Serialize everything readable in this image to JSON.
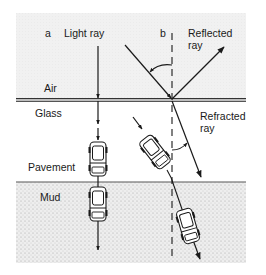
{
  "diagram": {
    "panels": [
      {
        "id": "a",
        "label": "a",
        "ray_label": "Light ray"
      },
      {
        "id": "b",
        "label": "b"
      }
    ],
    "media": {
      "air": "Air",
      "glass": "Glass",
      "pavement": "Pavement",
      "mud": "Mud"
    },
    "rays": {
      "reflected_line1": "Reflected",
      "reflected_line2": "ray",
      "refracted_line1": "Refracted",
      "refracted_line2": "ray"
    },
    "colors": {
      "air_fill": "#efefef",
      "mud_fill": "#e4e4e4",
      "line": "#1a1a1a",
      "boundary": "#555555"
    }
  }
}
